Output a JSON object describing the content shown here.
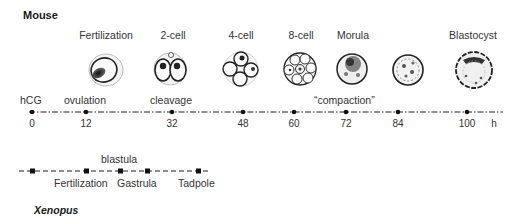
{
  "mouse": {
    "title": "Mouse",
    "stages": [
      {
        "label": "Fertilization",
        "x": 106
      },
      {
        "label": "2-cell",
        "x": 173
      },
      {
        "label": "4-cell",
        "x": 241
      },
      {
        "label": "8-cell",
        "x": 301
      },
      {
        "label": "Morula",
        "x": 353
      },
      {
        "label": "Blastocyst",
        "x": 473
      }
    ],
    "cells": [
      {
        "name": "zygote-cell",
        "x": 106
      },
      {
        "name": "two-cell-embryo",
        "x": 170
      },
      {
        "name": "four-cell-embryo",
        "x": 241
      },
      {
        "name": "eight-cell-embryo",
        "x": 300
      },
      {
        "name": "morula-embryo",
        "x": 352
      },
      {
        "name": "compacted-morula-embryo",
        "x": 408
      },
      {
        "name": "blastocyst-embryo",
        "x": 474
      }
    ],
    "events": {
      "hcg": "hCG",
      "ovulation": "ovulation",
      "cleavage": "cleavage",
      "compaction": "“compaction”"
    },
    "timeline": {
      "unit": "h",
      "ticks": [
        {
          "value": "0",
          "x": 32
        },
        {
          "value": "12",
          "x": 86
        },
        {
          "value": "32",
          "x": 172
        },
        {
          "value": "48",
          "x": 243
        },
        {
          "value": "60",
          "x": 294
        },
        {
          "value": "72",
          "x": 346
        },
        {
          "value": "84",
          "x": 398
        },
        {
          "value": "100",
          "x": 467
        }
      ]
    }
  },
  "xenopus": {
    "title": "Xenopus",
    "above_label": "blastula",
    "labels": [
      "Fertilization",
      "Gastrula",
      "Tadpole"
    ],
    "markers_x": [
      33,
      87,
      121,
      148,
      199
    ]
  }
}
